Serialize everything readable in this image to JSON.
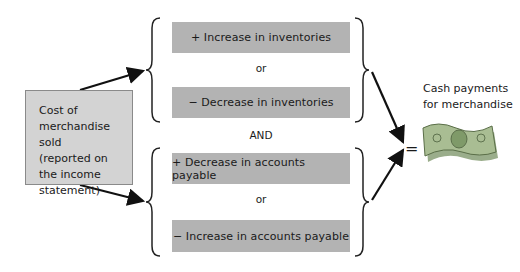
{
  "diagram": {
    "source": {
      "lines": [
        "Cost of",
        "merchandise sold",
        "(reported on",
        "the income",
        "statement)"
      ]
    },
    "group_top": {
      "box1": "+ Increase in inventories",
      "or": "or",
      "box2": "− Decrease in inventories"
    },
    "connector": "AND",
    "group_bottom": {
      "box1": "+ Decrease in accounts payable",
      "or": "or",
      "box2": "− Increase in accounts payable"
    },
    "equals": "=",
    "result": {
      "lines": [
        "Cash payments",
        "for merchandise"
      ],
      "icon": "cash-money-icon"
    },
    "colors": {
      "box_fill": "#b3b3b3",
      "source_fill": "#d3d3d3",
      "arrow": "#111111"
    }
  }
}
